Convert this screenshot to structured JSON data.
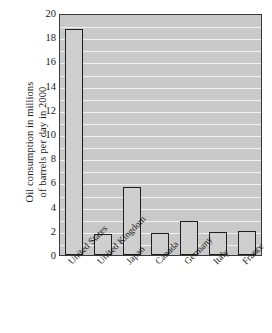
{
  "chart_data": {
    "type": "bar",
    "title": "",
    "subtitle": "",
    "xlabel": "",
    "ylabel": "Oil consumption in millions of barrels per day in 2000",
    "ylabel_lines": [
      "Oil consumption in millions",
      "of barrels per day in 2000"
    ],
    "categories": [
      "United States",
      "United Kingdom",
      "Japan",
      "Canada",
      "Germany",
      "Italy",
      "France"
    ],
    "values": [
      18.7,
      1.7,
      5.6,
      1.8,
      2.8,
      1.9,
      2.0
    ],
    "ylim": [
      0,
      20
    ],
    "ytick_values": [
      0,
      2,
      4,
      6,
      8,
      10,
      12,
      14,
      16,
      18,
      20
    ],
    "ytick_labels": [
      "0",
      "2",
      "4",
      "6",
      "8",
      "10",
      "12",
      "14",
      "16",
      "18",
      "20"
    ],
    "minor_tick_step": 1,
    "grid": true,
    "grid_orientation": "horizontal",
    "legend": "none",
    "xtick_rotation": -45,
    "colors": {
      "plot_background": "#c9c9c9",
      "gridline": "#f2f2f2",
      "bar_fill": "#cfcfcf",
      "bar_edge": "#1f1f1f",
      "axis": "#3a3a3a",
      "text": "#1a1a1a",
      "figure_background": "#ffffff"
    }
  }
}
